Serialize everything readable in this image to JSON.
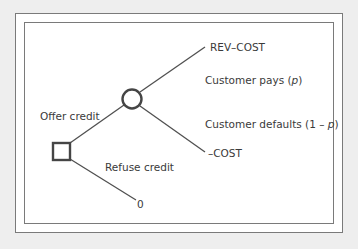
{
  "diagram": {
    "type": "decision-tree",
    "decision_node": {
      "shape": "square",
      "label": "Offer credit / Refuse credit decision"
    },
    "chance_node": {
      "shape": "circle"
    },
    "branches": {
      "offer": "Offer credit",
      "refuse": "Refuse credit",
      "pays_prefix": "Customer pays (",
      "pays_var": "p",
      "pays_suffix": ")",
      "defaults_prefix": "Customer defaults (1 – ",
      "defaults_var": "p",
      "defaults_suffix": ")"
    },
    "outcomes": {
      "pays": "REV–COST",
      "defaults": "–COST",
      "refuse": "0"
    },
    "colors": {
      "background": "#eeeeee",
      "frame": "#7a7a7a",
      "line": "#505050",
      "node": "#454545",
      "text": "#3a3a3a"
    }
  }
}
